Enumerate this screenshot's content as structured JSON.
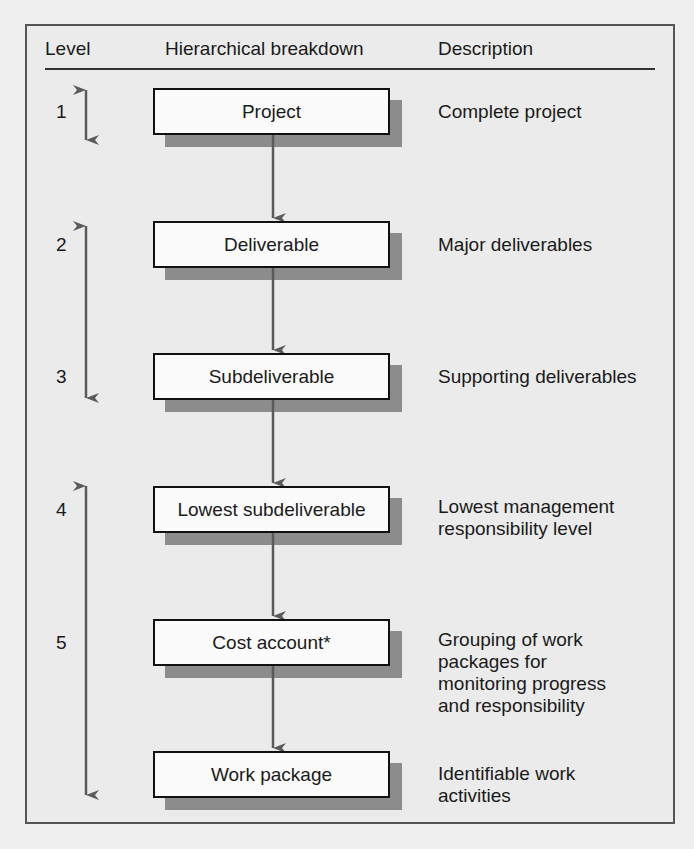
{
  "header": {
    "level": "Level",
    "breakdown": "Hierarchical breakdown",
    "description": "Description"
  },
  "levels": [
    {
      "number": "1",
      "box": "Project",
      "description": "Complete project"
    },
    {
      "number": "2",
      "box": "Deliverable",
      "description": "Major deliverables"
    },
    {
      "number": "3",
      "box": "Subdeliverable",
      "description": "Supporting deliverables"
    },
    {
      "number": "4",
      "box": "Lowest subdeliverable",
      "description": "Lowest management\nresponsibility level"
    },
    {
      "number": "5",
      "box": "Cost account*",
      "description": "Grouping of work\npackages for\nmonitoring progress\nand responsibility"
    },
    {
      "number": "",
      "box": "Work package",
      "description": "Identifiable work\nactivities"
    }
  ],
  "colors": {
    "arrow": "#5a5a5a",
    "box_border": "#111111",
    "box_fill": "#fbfbfb",
    "shadow": "#8c8c8c",
    "frame_bg": "#ebebeb"
  }
}
